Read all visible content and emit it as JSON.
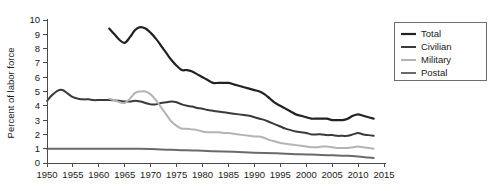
{
  "chart_data": {
    "type": "line",
    "title": "",
    "subtitle": "",
    "xlabel": "",
    "ylabel": "Percent of labor force",
    "xlim": [
      1950,
      2015
    ],
    "ylim": [
      0,
      10
    ],
    "xticks": [
      1950,
      1955,
      1960,
      1965,
      1970,
      1975,
      1980,
      1985,
      1990,
      1995,
      2000,
      2005,
      2010,
      2015
    ],
    "yticks": [
      0,
      1,
      2,
      3,
      4,
      5,
      6,
      7,
      8,
      9,
      10
    ],
    "grid": false,
    "legend_position": "top-right",
    "series": [
      {
        "name": "Total",
        "color": "#222222",
        "width": 2.2,
        "x": [
          1962,
          1963,
          1964,
          1965,
          1966,
          1967,
          1968,
          1969,
          1970,
          1971,
          1972,
          1973,
          1974,
          1975,
          1976,
          1977,
          1978,
          1979,
          1980,
          1981,
          1982,
          1983,
          1984,
          1985,
          1986,
          1987,
          1988,
          1989,
          1990,
          1991,
          1992,
          1993,
          1994,
          1995,
          1996,
          1997,
          1998,
          1999,
          2000,
          2001,
          2002,
          2003,
          2004,
          2005,
          2006,
          2007,
          2008,
          2009,
          2010,
          2011,
          2012,
          2013
        ],
        "y": [
          9.4,
          9.0,
          8.6,
          8.4,
          8.8,
          9.3,
          9.5,
          9.4,
          9.1,
          8.7,
          8.2,
          7.7,
          7.2,
          6.8,
          6.5,
          6.5,
          6.4,
          6.2,
          6.0,
          5.8,
          5.6,
          5.6,
          5.6,
          5.6,
          5.5,
          5.4,
          5.3,
          5.2,
          5.1,
          5.0,
          4.8,
          4.5,
          4.2,
          4.0,
          3.8,
          3.6,
          3.4,
          3.3,
          3.2,
          3.1,
          3.1,
          3.1,
          3.1,
          3.0,
          3.0,
          3.0,
          3.1,
          3.3,
          3.4,
          3.3,
          3.2,
          3.1
        ]
      },
      {
        "name": "Civilian",
        "color": "#3a3a3a",
        "width": 2.0,
        "x": [
          1950,
          1951,
          1952,
          1953,
          1954,
          1955,
          1956,
          1957,
          1958,
          1959,
          1960,
          1961,
          1962,
          1963,
          1964,
          1965,
          1966,
          1967,
          1968,
          1969,
          1970,
          1971,
          1972,
          1973,
          1974,
          1975,
          1976,
          1977,
          1978,
          1979,
          1980,
          1981,
          1982,
          1983,
          1984,
          1985,
          1986,
          1987,
          1988,
          1989,
          1990,
          1991,
          1992,
          1993,
          1994,
          1995,
          1996,
          1997,
          1998,
          1999,
          2000,
          2001,
          2002,
          2003,
          2004,
          2005,
          2006,
          2007,
          2008,
          2009,
          2010,
          2011,
          2012,
          2013
        ],
        "y": [
          4.35,
          4.75,
          5.05,
          5.1,
          4.85,
          4.6,
          4.5,
          4.45,
          4.45,
          4.4,
          4.4,
          4.4,
          4.4,
          4.38,
          4.35,
          4.3,
          4.3,
          4.35,
          4.3,
          4.2,
          4.1,
          4.1,
          4.2,
          4.25,
          4.3,
          4.25,
          4.1,
          4.0,
          3.95,
          3.85,
          3.8,
          3.7,
          3.65,
          3.6,
          3.55,
          3.5,
          3.45,
          3.4,
          3.35,
          3.3,
          3.2,
          3.1,
          3.0,
          2.85,
          2.7,
          2.55,
          2.4,
          2.3,
          2.2,
          2.15,
          2.1,
          2.0,
          2.0,
          2.0,
          1.95,
          1.95,
          1.9,
          1.9,
          1.9,
          2.0,
          2.1,
          2.0,
          1.95,
          1.9
        ]
      },
      {
        "name": "Military",
        "color": "#b4b4b4",
        "width": 2.0,
        "x": [
          1962,
          1963,
          1964,
          1965,
          1966,
          1967,
          1968,
          1969,
          1970,
          1971,
          1972,
          1973,
          1974,
          1975,
          1976,
          1977,
          1978,
          1979,
          1980,
          1981,
          1982,
          1983,
          1984,
          1985,
          1986,
          1987,
          1988,
          1989,
          1990,
          1991,
          1992,
          1993,
          1994,
          1995,
          1996,
          1997,
          1998,
          1999,
          2000,
          2001,
          2002,
          2003,
          2004,
          2005,
          2006,
          2007,
          2008,
          2009,
          2010,
          2011,
          2012,
          2013
        ],
        "y": [
          4.5,
          4.4,
          4.25,
          4.2,
          4.5,
          4.9,
          5.0,
          5.0,
          4.8,
          4.4,
          3.9,
          3.4,
          2.9,
          2.6,
          2.4,
          2.4,
          2.35,
          2.3,
          2.2,
          2.15,
          2.15,
          2.15,
          2.1,
          2.1,
          2.05,
          2.0,
          1.95,
          1.9,
          1.85,
          1.85,
          1.75,
          1.6,
          1.5,
          1.4,
          1.35,
          1.3,
          1.25,
          1.2,
          1.15,
          1.1,
          1.1,
          1.15,
          1.15,
          1.1,
          1.05,
          1.05,
          1.05,
          1.1,
          1.15,
          1.1,
          1.05,
          1.0
        ]
      },
      {
        "name": "Postal",
        "color": "#6a6a6a",
        "width": 2.0,
        "x": [
          1950,
          1952,
          1954,
          1956,
          1958,
          1960,
          1962,
          1964,
          1966,
          1968,
          1970,
          1972,
          1974,
          1976,
          1978,
          1980,
          1982,
          1984,
          1986,
          1988,
          1990,
          1992,
          1994,
          1996,
          1998,
          2000,
          2002,
          2004,
          2006,
          2008,
          2010,
          2012,
          2013
        ],
        "y": [
          1.0,
          1.0,
          1.0,
          1.0,
          1.0,
          1.0,
          1.0,
          1.0,
          1.0,
          1.0,
          0.98,
          0.95,
          0.92,
          0.9,
          0.88,
          0.85,
          0.82,
          0.8,
          0.78,
          0.75,
          0.72,
          0.7,
          0.68,
          0.65,
          0.62,
          0.6,
          0.58,
          0.55,
          0.52,
          0.5,
          0.45,
          0.38,
          0.35
        ]
      }
    ]
  },
  "legend": {
    "entries": [
      {
        "label": "Total"
      },
      {
        "label": "Civilian"
      },
      {
        "label": "Military"
      },
      {
        "label": "Postal"
      }
    ]
  }
}
